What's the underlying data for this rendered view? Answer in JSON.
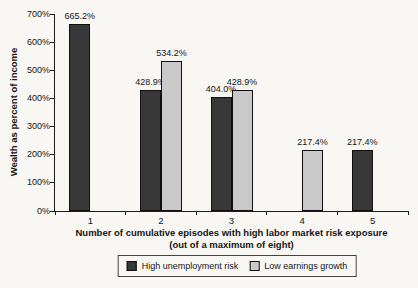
{
  "chart_data": {
    "type": "bar",
    "title": "",
    "categories": [
      "1",
      "2",
      "3",
      "4",
      "5"
    ],
    "series": [
      {
        "name": "High unemployment risk",
        "color": "#383838",
        "values": [
          665.2,
          428.9,
          404.0,
          null,
          217.4
        ]
      },
      {
        "name": "Low earnings growth",
        "color": "#c9c9c9",
        "values": [
          null,
          534.2,
          428.9,
          217.4,
          null
        ]
      }
    ],
    "data_labels": {
      "High unemployment risk": [
        "665.2%",
        "428.9%",
        "404.0%",
        null,
        "217.4%"
      ],
      "Low earnings growth": [
        null,
        "534.2%",
        "428.9%",
        "217.4%",
        null
      ]
    },
    "value_suffix": "%",
    "ylabel": "Wealth as percent of income",
    "xlabel_line1": "Number of cumulative episodes with high labor market risk exposure",
    "xlabel_line2": "(out of a maximum of eight)",
    "ylim": [
      0,
      700
    ],
    "ytick_step": 100,
    "yticks": [
      "0%",
      "100%",
      "200%",
      "300%",
      "400%",
      "500%",
      "600%",
      "700%"
    ],
    "grid": false,
    "legend_position": "bottom"
  }
}
